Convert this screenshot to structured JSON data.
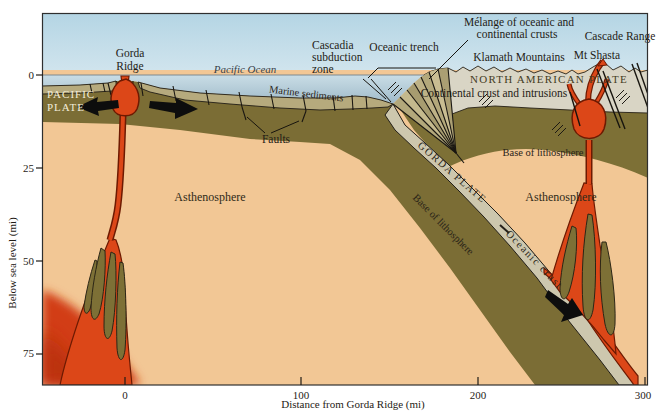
{
  "figure_type": "geologic-cross-section",
  "axes": {
    "x": {
      "title": "Distance from Gorda Ridge (mi)",
      "ticks": [
        "0",
        "100",
        "200",
        "300"
      ]
    },
    "y": {
      "title": "Below sea level (mi)",
      "ticks": [
        "0",
        "25",
        "50",
        "75"
      ]
    }
  },
  "labels": {
    "gorda_ridge": [
      "Gorda",
      "Ridge"
    ],
    "pacific_ocean": "Pacific Ocean",
    "cascadia_subduction_zone": [
      "Cascadia",
      "subduction",
      "zone"
    ],
    "oceanic_trench": "Oceanic trench",
    "melange": [
      "Mélange of oceanic and",
      "continental crusts"
    ],
    "cascade_range": "Cascade Range",
    "klamath_mountains": "Klamath Mountains",
    "mt_shasta": "Mt Shasta",
    "north_american_plate": "NORTH AMERICAN PLATE",
    "continental_crust": "Continental crust and intrusions",
    "pacific_plate": [
      "PACIFIC",
      "PLATE"
    ],
    "marine_sediments": "Marine sediments",
    "faults": "Faults",
    "gorda_plate": "GORDA PLATE",
    "base_of_lithosphere_slab": "Base of lithosphere",
    "base_of_lithosphere_right": "Base of lithosphere",
    "oceanic_crust": "Oceanic crust",
    "asthenosphere_left": "Asthenosphere",
    "asthenosphere_right": "Asthenosphere"
  },
  "palette": {
    "sky": "#b9d8e5",
    "ocean": "#aec6d2",
    "asthenosphere": "#f2c795",
    "lithosphere_olive": "#7b6d35",
    "marine_sediments_khaki": "#b6aa7d",
    "oceanic_crust_gray": "#cdc7ae",
    "continental_crust_gray": "#d9d5c5",
    "magma_red": "#dc4718",
    "magma_outline": "#6d1a02",
    "line_dark": "#1f1c16"
  }
}
